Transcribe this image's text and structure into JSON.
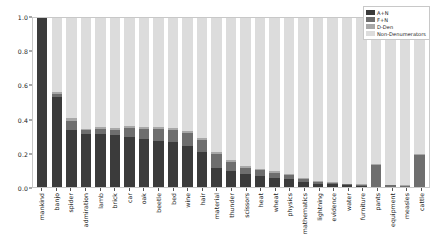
{
  "chart_data": {
    "type": "bar",
    "stacked": true,
    "title": "",
    "xlabel": "",
    "ylabel": "",
    "ylim": [
      0.0,
      1.0
    ],
    "ytick_labels": [
      "0.0",
      "0.2",
      "0.4",
      "0.6",
      "0.8",
      "1.0"
    ],
    "ytick_values": [
      0.0,
      0.2,
      0.4,
      0.6,
      0.8,
      1.0
    ],
    "grid": false,
    "legend_position": "upper right",
    "categories": [
      "mankind",
      "banjo",
      "spider",
      "admiration",
      "lamb",
      "brick",
      "car",
      "oak",
      "beetle",
      "bed",
      "wine",
      "hair",
      "material",
      "thunder",
      "scissors",
      "heat",
      "wheat",
      "physics",
      "mathematics",
      "lightning",
      "evidence",
      "water",
      "furniture",
      "pants",
      "equipment",
      "measles",
      "cattle"
    ],
    "series": [
      {
        "name": "A+N",
        "color": "#3b3b3b",
        "values": [
          1.0,
          0.535,
          0.335,
          0.315,
          0.315,
          0.305,
          0.295,
          0.285,
          0.275,
          0.265,
          0.245,
          0.205,
          0.115,
          0.095,
          0.075,
          0.065,
          0.055,
          0.045,
          0.03,
          0.02,
          0.015,
          0.01,
          0.008,
          0.0,
          0.0,
          0.0,
          0.0
        ]
      },
      {
        "name": "F+N",
        "color": "#6e6e6e",
        "values": [
          0.0,
          0.015,
          0.055,
          0.02,
          0.03,
          0.035,
          0.055,
          0.06,
          0.07,
          0.075,
          0.075,
          0.075,
          0.08,
          0.055,
          0.04,
          0.035,
          0.03,
          0.025,
          0.02,
          0.01,
          0.008,
          0.006,
          0.005,
          0.13,
          0.01,
          0.008,
          0.19
        ]
      },
      {
        "name": "D-Den",
        "color": "#a8a8a8",
        "values": [
          0.0,
          0.01,
          0.02,
          0.01,
          0.01,
          0.012,
          0.012,
          0.012,
          0.012,
          0.012,
          0.012,
          0.012,
          0.012,
          0.01,
          0.008,
          0.008,
          0.008,
          0.008,
          0.006,
          0.005,
          0.004,
          0.004,
          0.003,
          0.006,
          0.004,
          0.004,
          0.006
        ]
      },
      {
        "name": "Non-Denumerators",
        "color": "#dcdcdc",
        "values": [
          0.0,
          0.44,
          0.59,
          0.655,
          0.645,
          0.648,
          0.638,
          0.643,
          0.643,
          0.648,
          0.668,
          0.708,
          0.793,
          0.84,
          0.877,
          0.892,
          0.907,
          0.922,
          0.944,
          0.965,
          0.973,
          0.98,
          0.984,
          0.864,
          0.986,
          0.988,
          0.804
        ]
      }
    ],
    "legend_entries": [
      "A+N",
      "F+N",
      "D-Den",
      "Non-Denumerators"
    ]
  }
}
